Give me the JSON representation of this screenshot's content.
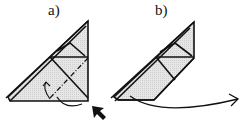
{
  "panels": [
    {
      "label": "a)",
      "description": "triangle with dash-dot fold line and curved arrow, pointer arrow at bottom-right corner"
    },
    {
      "label": "b)",
      "description": "folded shape after swivel, long curved arrow to the right"
    }
  ],
  "colors": {
    "fill": "#e2e2e2",
    "stroke": "#111111"
  }
}
